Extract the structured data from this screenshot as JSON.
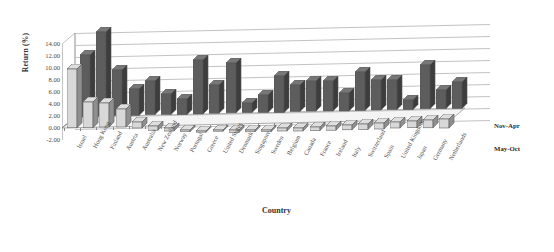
{
  "chart_data": {
    "type": "bar",
    "title": "",
    "xlabel": "Country",
    "ylabel": "Return (%)",
    "ylim": [
      -2.0,
      14.0
    ],
    "ytick_step": 2.0,
    "ytick_labels": [
      "14.00",
      "12.00",
      "10.00",
      "8.00",
      "6.00",
      "4.00",
      "2.00",
      "0.00",
      "-2.00"
    ],
    "grid": true,
    "three_d": true,
    "legend_position": "right",
    "categories": [
      "Israel",
      "Hong Kong",
      "Finland",
      "Austria",
      "Australia",
      "New Zealand",
      "Norway",
      "Portugal",
      "Greece",
      "United States",
      "Denmark",
      "Singapore",
      "Sweden",
      "Belgium",
      "Canada",
      "France",
      "Ireland",
      "Italy",
      "Switzerland",
      "Spain",
      "United Kingdom",
      "Japan",
      "Germany",
      "Netherlands"
    ],
    "series": [
      {
        "name": "Nov-Apr",
        "color": "#5d5d5d",
        "values": [
          10.3,
          14.0,
          7.6,
          4.4,
          5.6,
          3.4,
          2.6,
          9.0,
          4.7,
          8.3,
          1.6,
          2.9,
          6.1,
          4.4,
          5.0,
          5.0,
          3.0,
          6.4,
          5.0,
          4.9,
          1.6,
          7.3,
          3.1,
          4.4
        ]
      },
      {
        "name": "May-Oct",
        "color": "#d8d8d8",
        "values": [
          9.8,
          4.3,
          4.0,
          3.0,
          1.0,
          0.7,
          0.5,
          0.3,
          0.2,
          0.2,
          -0.4,
          -0.3,
          -0.3,
          -0.5,
          -0.5,
          -0.6,
          -0.7,
          -0.8,
          -0.9,
          -1.0,
          -1.0,
          -1.1,
          -1.3,
          -1.5
        ]
      }
    ]
  },
  "legend": {
    "entries": [
      {
        "label": "Nov-Apr"
      },
      {
        "label": "May-Oct"
      }
    ]
  }
}
